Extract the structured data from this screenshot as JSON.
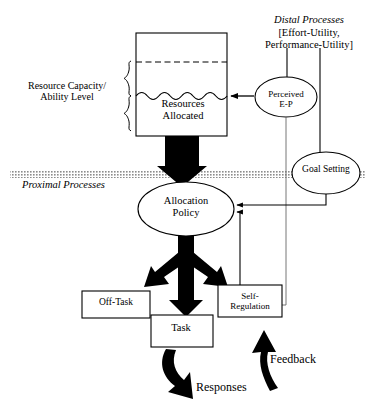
{
  "figure": {
    "background_color": "#ffffff",
    "line_color": "#000000",
    "fill_color": "#000000",
    "band_color": "#9a9a9a",
    "width": 379,
    "height": 413
  },
  "labels": {
    "resource_capacity": "Resource Capacity/\nAbility Level",
    "distal_processes": "Distal Processes",
    "distal_bracket_line1": "[Effort-Utility,",
    "distal_bracket_line2": "Performance-Utility]",
    "resources_allocated": "Resources\nAllocated",
    "perceived_ep": "Perceived\nE-P",
    "goal_setting": "Goal Setting",
    "proximal_processes": "Proximal Processes",
    "allocation_policy": "Allocation\nPolicy",
    "off_task": "Off-Task",
    "task": "Task",
    "self_regulation": "Self-\nRegulation",
    "feedback": "Feedback",
    "responses": "Responses"
  },
  "nodes": [
    {
      "id": "resource-container",
      "type": "rect",
      "label": "Resources Allocated",
      "x": 136,
      "y": 33,
      "w": 91,
      "h": 103
    },
    {
      "id": "perceived-ep",
      "type": "ellipse",
      "label": "Perceived E-P",
      "cx": 286,
      "cy": 97,
      "rx": 31,
      "ry": 20
    },
    {
      "id": "goal-setting",
      "type": "ellipse",
      "label": "Goal Setting",
      "cx": 326,
      "cy": 173,
      "rx": 34,
      "ry": 21
    },
    {
      "id": "allocation-policy",
      "type": "ellipse",
      "label": "Allocation Policy",
      "cx": 186,
      "cy": 209,
      "rx": 48,
      "ry": 27
    },
    {
      "id": "off-task",
      "type": "rect",
      "label": "Off-Task",
      "x": 82,
      "y": 291,
      "w": 68,
      "h": 27
    },
    {
      "id": "task",
      "type": "rect",
      "label": "Task",
      "x": 151,
      "y": 315,
      "w": 62,
      "h": 32
    },
    {
      "id": "self-regulation",
      "type": "rect",
      "label": "Self-Regulation",
      "x": 218,
      "y": 285,
      "w": 64,
      "h": 32
    }
  ],
  "connectors": [
    {
      "id": "distal-to-perceived",
      "from": "distal-processes",
      "to": "perceived-ep",
      "style": "thin-line"
    },
    {
      "id": "distal-to-goal",
      "from": "distal-processes",
      "to": "goal-setting",
      "style": "thin-line"
    },
    {
      "id": "perceived-to-resources",
      "from": "perceived-ep",
      "to": "resource-container",
      "style": "arrow-left"
    },
    {
      "id": "perceived-to-self-regulation",
      "from": "perceived-ep",
      "to": "self-regulation",
      "style": "thin-line"
    },
    {
      "id": "goal-to-allocation",
      "from": "goal-setting",
      "to": "allocation-policy",
      "style": "arrow-left"
    },
    {
      "id": "selfreg-to-allocation",
      "from": "self-regulation",
      "to": "allocation-policy",
      "style": "arrow-left"
    },
    {
      "id": "resources-to-allocation",
      "from": "resource-container",
      "to": "allocation-policy",
      "style": "thick-black-arrow"
    },
    {
      "id": "allocation-to-offtask",
      "from": "allocation-policy",
      "to": "off-task",
      "style": "thick-black-arrow"
    },
    {
      "id": "allocation-to-task",
      "from": "allocation-policy",
      "to": "task",
      "style": "thick-black-arrow"
    },
    {
      "id": "allocation-to-selfreg",
      "from": "allocation-policy",
      "to": "self-regulation",
      "style": "thick-black-arrow"
    },
    {
      "id": "task-to-responses",
      "from": "task",
      "to": "responses",
      "style": "thick-curved-arrow"
    },
    {
      "id": "feedback-to-selfreg",
      "from": "feedback",
      "to": "self-regulation",
      "style": "thick-curved-arrow"
    }
  ],
  "band": {
    "id": "proximal-divider",
    "label": "Proximal Processes",
    "y": 171,
    "height": 7
  }
}
